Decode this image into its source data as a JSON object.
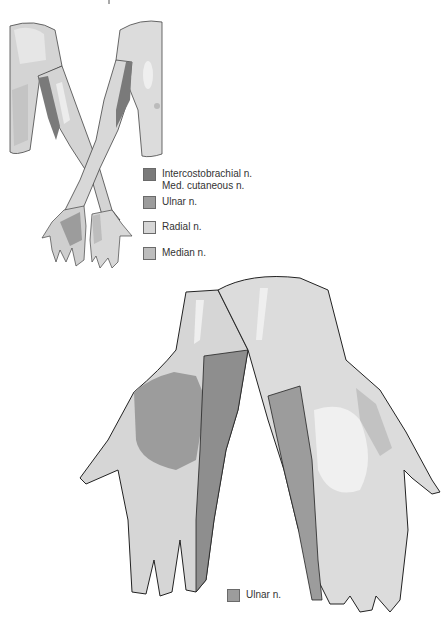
{
  "figure": {
    "upper_panel": {
      "description": "Both arms crossed, anterior/posterior views showing nerve territories",
      "legend": [
        {
          "lines": [
            "Intercostobrachial n.",
            "Med. cutaneous n."
          ],
          "color": "#7a7a7a",
          "name": "intercostobrachial-med-cutaneous"
        },
        {
          "lines": [
            "Ulnar n."
          ],
          "color": "#9c9c9c",
          "name": "ulnar"
        },
        {
          "lines": [
            "Radial n."
          ],
          "color": "#d6d6d6",
          "name": "radial"
        },
        {
          "lines": [
            "Median n."
          ],
          "color": "#bdbdbd",
          "name": "median"
        }
      ]
    },
    "lower_panel": {
      "description": "Enlarged crossed hands, palmar and dorsal, showing ulnar nerve territory",
      "legend": [
        {
          "lines": [
            "Ulnar n."
          ],
          "color": "#9c9c9c",
          "name": "ulnar"
        }
      ]
    }
  },
  "colors": {
    "skin_base": "#d4d4d4",
    "skin_light": "#e6e6e6",
    "highlight": "#f2f2f2",
    "dark_zone": "#7a7a7a",
    "ulnar_zone": "#9c9c9c",
    "median_zone": "#bdbdbd",
    "outline": "#2a2a2a"
  }
}
